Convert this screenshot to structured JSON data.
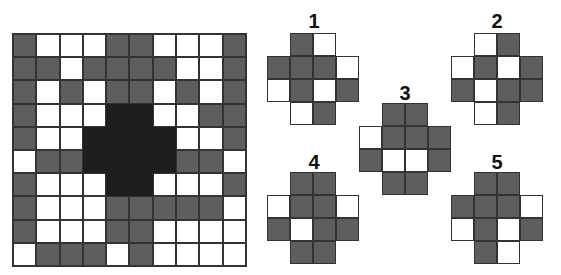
{
  "puzzle": {
    "main_grid": {
      "rows": [
        [
          "G",
          "W",
          "W",
          "W",
          "G",
          "G",
          "W",
          "W",
          "W",
          "G"
        ],
        [
          "G",
          "G",
          "W",
          "G",
          "G",
          "G",
          "G",
          "W",
          "W",
          "G"
        ],
        [
          "G",
          "W",
          "G",
          "W",
          "G",
          "G",
          "W",
          "G",
          "W",
          "G"
        ],
        [
          "G",
          "W",
          "W",
          "W",
          "B",
          "B",
          "W",
          "W",
          "G",
          "G"
        ],
        [
          "G",
          "W",
          "W",
          "B",
          "B",
          "B",
          "B",
          "W",
          "W",
          "G"
        ],
        [
          "W",
          "G",
          "G",
          "B",
          "B",
          "B",
          "B",
          "G",
          "G",
          "W"
        ],
        [
          "G",
          "W",
          "W",
          "W",
          "B",
          "B",
          "W",
          "W",
          "W",
          "G"
        ],
        [
          "G",
          "W",
          "W",
          "W",
          "G",
          "G",
          "G",
          "G",
          "G",
          "W"
        ],
        [
          "G",
          "W",
          "W",
          "W",
          "G",
          "G",
          "W",
          "W",
          "W",
          "W"
        ],
        [
          "W",
          "G",
          "G",
          "G",
          "W",
          "G",
          "W",
          "W",
          "W",
          "W"
        ]
      ],
      "legend": {
        "G": "gray filled",
        "W": "white",
        "B": "black missing region"
      }
    },
    "options": [
      {
        "label": "1",
        "rows": [
          [
            "E",
            "G",
            "W",
            "E"
          ],
          [
            "G",
            "G",
            "G",
            "W"
          ],
          [
            "W",
            "G",
            "W",
            "G"
          ],
          [
            "E",
            "W",
            "G",
            "E"
          ]
        ]
      },
      {
        "label": "2",
        "rows": [
          [
            "E",
            "W",
            "G",
            "E"
          ],
          [
            "W",
            "G",
            "W",
            "G"
          ],
          [
            "G",
            "W",
            "G",
            "G"
          ],
          [
            "E",
            "W",
            "G",
            "E"
          ]
        ]
      },
      {
        "label": "3",
        "rows": [
          [
            "E",
            "G",
            "G",
            "E"
          ],
          [
            "W",
            "G",
            "G",
            "G"
          ],
          [
            "G",
            "W",
            "W",
            "G"
          ],
          [
            "E",
            "G",
            "G",
            "E"
          ]
        ]
      },
      {
        "label": "4",
        "rows": [
          [
            "E",
            "G",
            "G",
            "E"
          ],
          [
            "W",
            "G",
            "G",
            "W"
          ],
          [
            "G",
            "W",
            "G",
            "G"
          ],
          [
            "E",
            "G",
            "G",
            "E"
          ]
        ]
      },
      {
        "label": "5",
        "rows": [
          [
            "E",
            "G",
            "G",
            "E"
          ],
          [
            "G",
            "G",
            "G",
            "W"
          ],
          [
            "W",
            "G",
            "W",
            "G"
          ],
          [
            "E",
            "G",
            "W",
            "E"
          ]
        ]
      }
    ],
    "colors": {
      "gray": "#5e5e5e",
      "white": "#ffffff",
      "black": "#1e1e1e",
      "line": "#333333"
    }
  }
}
